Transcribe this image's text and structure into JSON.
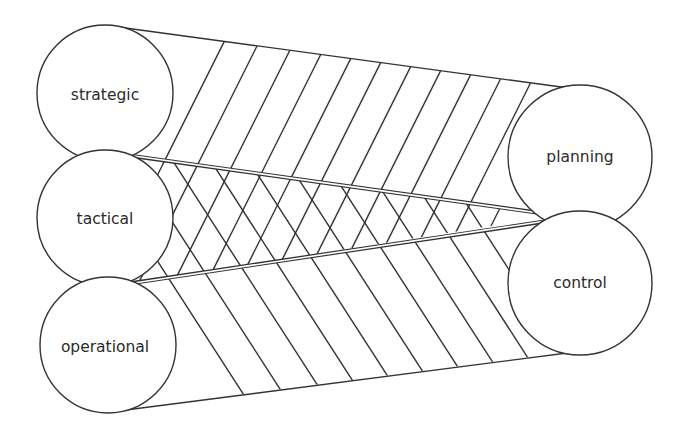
{
  "diagram": {
    "left_nodes": [
      {
        "id": "strategic",
        "label": "strategic"
      },
      {
        "id": "tactical",
        "label": "tactical"
      },
      {
        "id": "operational",
        "label": "operational"
      }
    ],
    "right_nodes": [
      {
        "id": "planning",
        "label": "planning"
      },
      {
        "id": "control",
        "label": "control"
      }
    ],
    "colors": {
      "line": "#333333",
      "text": "#2b2b2b",
      "background": "#ffffff"
    }
  }
}
